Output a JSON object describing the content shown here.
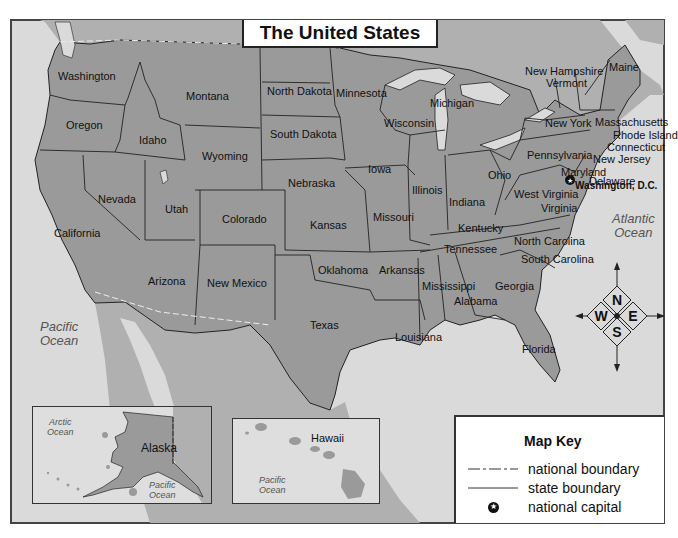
{
  "title": "The United States",
  "colors": {
    "land_us": "#9a9a9a",
    "land_foreign": "#b4b4b4",
    "water": "#dcdcdc",
    "border": "#222222",
    "frame": "#444444"
  },
  "states": [
    {
      "name": "Washington",
      "x": 58,
      "y": 71
    },
    {
      "name": "Oregon",
      "x": 66,
      "y": 120
    },
    {
      "name": "Idaho",
      "x": 139,
      "y": 135
    },
    {
      "name": "Montana",
      "x": 186,
      "y": 91
    },
    {
      "name": "Wyoming",
      "x": 202,
      "y": 151
    },
    {
      "name": "North Dakota",
      "x": 267,
      "y": 86
    },
    {
      "name": "South Dakota",
      "x": 270,
      "y": 129
    },
    {
      "name": "Minnesota",
      "x": 336,
      "y": 88
    },
    {
      "name": "Wisconsin",
      "x": 384,
      "y": 118
    },
    {
      "name": "Michigan",
      "x": 430,
      "y": 98
    },
    {
      "name": "Nebraska",
      "x": 288,
      "y": 178
    },
    {
      "name": "Iowa",
      "x": 368,
      "y": 164
    },
    {
      "name": "Illinois",
      "x": 412,
      "y": 185
    },
    {
      "name": "Indiana",
      "x": 449,
      "y": 197
    },
    {
      "name": "Ohio",
      "x": 488,
      "y": 170
    },
    {
      "name": "Pennsylvania",
      "x": 527,
      "y": 150
    },
    {
      "name": "New York",
      "x": 545,
      "y": 118
    },
    {
      "name": "New Hampshire",
      "x": 525,
      "y": 66
    },
    {
      "name": "Vermont",
      "x": 546,
      "y": 78
    },
    {
      "name": "Maine",
      "x": 609,
      "y": 62
    },
    {
      "name": "Massachusetts",
      "x": 595,
      "y": 117
    },
    {
      "name": "Rhode Island",
      "x": 613,
      "y": 130
    },
    {
      "name": "Connecticut",
      "x": 607,
      "y": 142
    },
    {
      "name": "New Jersey",
      "x": 593,
      "y": 154
    },
    {
      "name": "Maryland",
      "x": 561,
      "y": 167
    },
    {
      "name": "Delaware",
      "x": 589,
      "y": 176
    },
    {
      "name": "West Virginia",
      "x": 514,
      "y": 189
    },
    {
      "name": "Virginia",
      "x": 541,
      "y": 203
    },
    {
      "name": "Nevada",
      "x": 98,
      "y": 194
    },
    {
      "name": "Utah",
      "x": 165,
      "y": 204
    },
    {
      "name": "Colorado",
      "x": 222,
      "y": 214
    },
    {
      "name": "Kansas",
      "x": 310,
      "y": 220
    },
    {
      "name": "Missouri",
      "x": 373,
      "y": 212
    },
    {
      "name": "Kentucky",
      "x": 458,
      "y": 223
    },
    {
      "name": "California",
      "x": 54,
      "y": 228
    },
    {
      "name": "Arizona",
      "x": 148,
      "y": 276
    },
    {
      "name": "New Mexico",
      "x": 207,
      "y": 278
    },
    {
      "name": "Oklahoma",
      "x": 318,
      "y": 265
    },
    {
      "name": "Arkansas",
      "x": 379,
      "y": 265
    },
    {
      "name": "Tennessee",
      "x": 444,
      "y": 244
    },
    {
      "name": "North Carolina",
      "x": 514,
      "y": 236
    },
    {
      "name": "South Carolina",
      "x": 521,
      "y": 254
    },
    {
      "name": "Mississippi",
      "x": 422,
      "y": 281
    },
    {
      "name": "Alabama",
      "x": 454,
      "y": 296
    },
    {
      "name": "Georgia",
      "x": 495,
      "y": 281
    },
    {
      "name": "Texas",
      "x": 310,
      "y": 320
    },
    {
      "name": "Louisiana",
      "x": 395,
      "y": 332
    },
    {
      "name": "Florida",
      "x": 522,
      "y": 344
    }
  ],
  "capital": {
    "label": "Washington, D.C.",
    "x": 573,
    "y": 183
  },
  "oceans": [
    {
      "name": "Pacific\nOcean",
      "x": 40,
      "y": 320,
      "size": 13
    },
    {
      "name": "Atlantic\nOcean",
      "x": 612,
      "y": 212,
      "size": 13
    }
  ],
  "compass": {
    "north": "N",
    "south": "S",
    "east": "E",
    "west": "W"
  },
  "insets": {
    "alaska": {
      "label": "Alaska",
      "ocean_north": "Arctic\nOcean",
      "ocean_south": "Pacific\nOcean"
    },
    "hawaii": {
      "label": "Hawaii",
      "ocean": "Pacific\nOcean"
    }
  },
  "map_key": {
    "title": "Map Key",
    "items": [
      {
        "symbol": "dash-line",
        "label": "national boundary"
      },
      {
        "symbol": "solid-line",
        "label": "state boundary"
      },
      {
        "symbol": "star-circle",
        "label": "national capital"
      }
    ]
  }
}
